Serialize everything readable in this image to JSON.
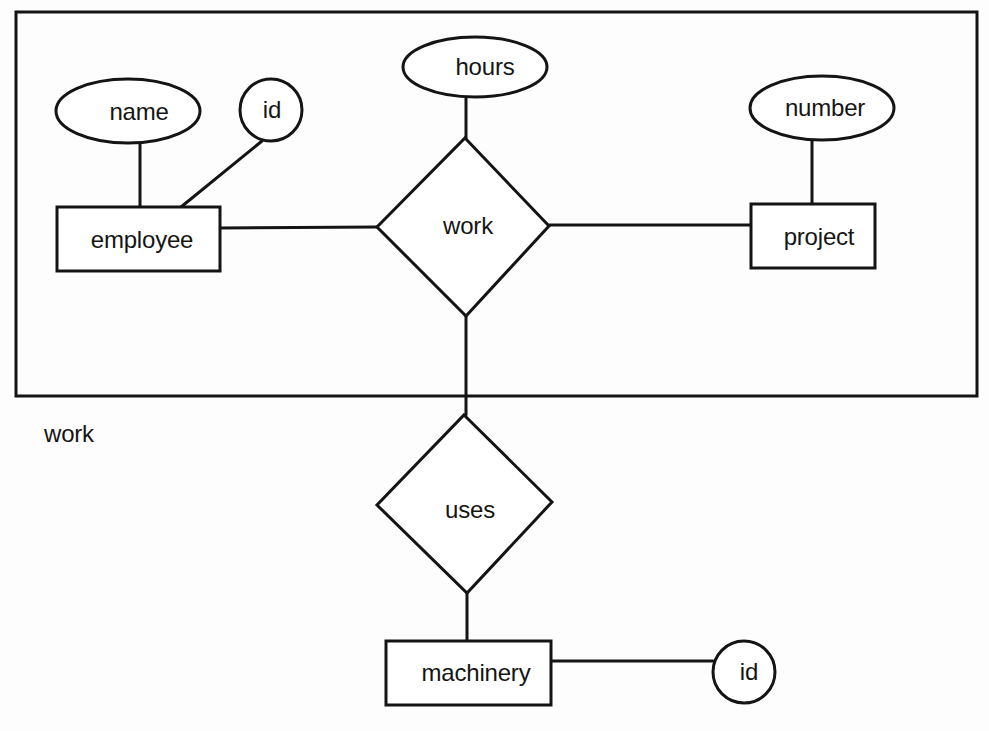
{
  "diagram": {
    "type": "entity-relationship",
    "aggregation": {
      "name": "work",
      "label": "work",
      "contains": [
        "employee",
        "work",
        "project"
      ]
    },
    "entities": [
      {
        "id": "employee",
        "label": "employee"
      },
      {
        "id": "project",
        "label": "project"
      },
      {
        "id": "machinery",
        "label": "machinery"
      }
    ],
    "relationships": [
      {
        "id": "work",
        "label": "work",
        "connects": [
          "employee",
          "project"
        ]
      },
      {
        "id": "uses",
        "label": "uses",
        "connects": [
          "work (aggregation)",
          "machinery"
        ]
      }
    ],
    "attributes": [
      {
        "id": "employee-name",
        "label": "name",
        "owner": "employee",
        "shape": "ellipse"
      },
      {
        "id": "employee-id",
        "label": "id",
        "owner": "employee",
        "shape": "circle"
      },
      {
        "id": "work-hours",
        "label": "hours",
        "owner": "work",
        "shape": "ellipse"
      },
      {
        "id": "project-number",
        "label": "number",
        "owner": "project",
        "shape": "ellipse"
      },
      {
        "id": "machinery-id",
        "label": "id",
        "owner": "machinery",
        "shape": "circle"
      }
    ],
    "labels": {
      "name": "name",
      "employee_id": "id",
      "employee": "employee",
      "hours": "hours",
      "work": "work",
      "number": "number",
      "project": "project",
      "aggregation": "work",
      "uses": "uses",
      "machinery": "machinery",
      "machinery_id": "id"
    },
    "colors": {
      "line": "#141414",
      "background": "#ffffff"
    }
  }
}
